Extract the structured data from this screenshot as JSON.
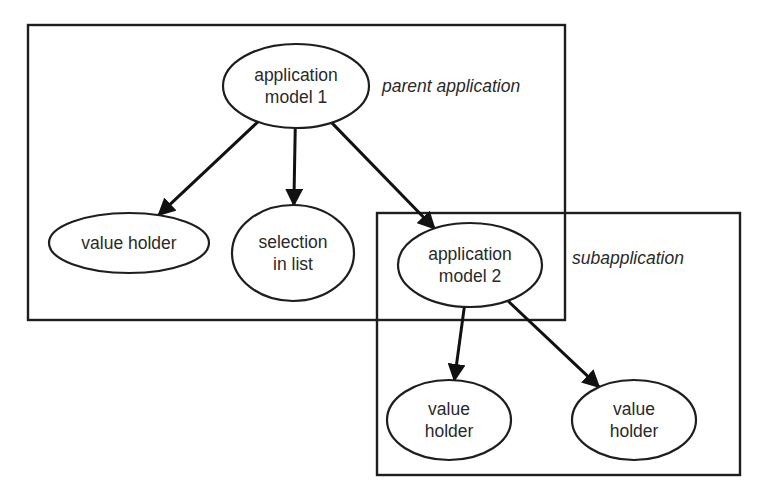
{
  "diagram": {
    "groups": [
      {
        "id": "parent",
        "label": "parent application",
        "x": 28,
        "y": 25,
        "w": 537,
        "h": 295,
        "label_x": 382,
        "label_y": 92
      },
      {
        "id": "sub",
        "label": "subapplication",
        "x": 377,
        "y": 213,
        "w": 363,
        "h": 262,
        "label_x": 572,
        "label_y": 264
      }
    ],
    "nodes": [
      {
        "id": "app1",
        "lines": [
          "application",
          "model 1"
        ],
        "cx": 296,
        "cy": 86,
        "rx": 73,
        "ry": 42
      },
      {
        "id": "vh1",
        "lines": [
          "value holder"
        ],
        "cx": 129,
        "cy": 243,
        "rx": 80,
        "ry": 30
      },
      {
        "id": "sel",
        "lines": [
          "selection",
          "in list"
        ],
        "cx": 293,
        "cy": 253,
        "rx": 61,
        "ry": 48
      },
      {
        "id": "app2",
        "lines": [
          "application",
          "model 2"
        ],
        "cx": 470,
        "cy": 265,
        "rx": 72,
        "ry": 42
      },
      {
        "id": "vh2",
        "lines": [
          "value",
          "holder"
        ],
        "cx": 449,
        "cy": 420,
        "rx": 62,
        "ry": 40
      },
      {
        "id": "vh3",
        "lines": [
          "value",
          "holder"
        ],
        "cx": 634,
        "cy": 420,
        "rx": 62,
        "ry": 40
      }
    ],
    "edges": [
      {
        "from": "app1",
        "to": "vh1"
      },
      {
        "from": "app1",
        "to": "sel"
      },
      {
        "from": "app1",
        "to": "app2"
      },
      {
        "from": "app2",
        "to": "vh2"
      },
      {
        "from": "app2",
        "to": "vh3"
      }
    ]
  }
}
